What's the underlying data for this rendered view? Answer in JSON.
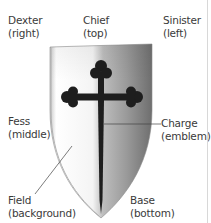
{
  "diagram": {
    "labels": {
      "dexter": {
        "term": "Dexter",
        "meaning": "(right)"
      },
      "chief": {
        "term": "Chief",
        "meaning": "(top)"
      },
      "sinister": {
        "term": "Sinister",
        "meaning": "(left)"
      },
      "fess": {
        "term": "Fess",
        "meaning": "(middle)"
      },
      "charge": {
        "term": "Charge",
        "meaning": "(emblem)"
      },
      "field": {
        "term": "Field",
        "meaning": "(background)"
      },
      "base": {
        "term": "Base",
        "meaning": "(bottom)"
      }
    },
    "shield": {
      "shape": "heater-shield",
      "charge_icon": "cross-botonny-icon",
      "colors": {
        "field_light": "#ffffff",
        "field_dark": "#6e6e6e",
        "charge": "#1e1e1e",
        "leader_line": "#444444",
        "text": "#3a3a3a"
      }
    }
  }
}
